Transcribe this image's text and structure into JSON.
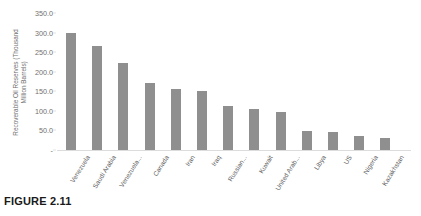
{
  "figure": {
    "caption": "FIGURE 2.11"
  },
  "chart_data": {
    "type": "bar",
    "title": "",
    "xlabel": "",
    "ylabel": "Recoverable Oil Reserves (Thousand Million Barrels)",
    "ylabel_line1": "Recoverable Oil Reserves (Thousand",
    "ylabel_line2": "Million Barrels)",
    "ylim": [
      0,
      350
    ],
    "ytick_step": 50,
    "ytick_labels": [
      "350.0",
      "300.0",
      "250.0",
      "200.0",
      "150.0",
      "100.0",
      "50.0",
      "-"
    ],
    "ytick_values": [
      350,
      300,
      250,
      200,
      150,
      100,
      50,
      0
    ],
    "grid": false,
    "legend": "none",
    "bar_color": "#8f8f8f",
    "categories": [
      "Venezuela",
      "Saudi Arabia",
      "Venezuela...",
      "Canada",
      "Iran",
      "Iraq",
      "Russian...",
      "Kuwait",
      "United Arab...",
      "Libya",
      "US",
      "Nigeria",
      "Kazakhstan"
    ],
    "values": [
      298,
      265,
      222,
      172,
      157,
      150,
      113,
      104,
      98,
      48,
      45,
      37,
      30
    ]
  }
}
